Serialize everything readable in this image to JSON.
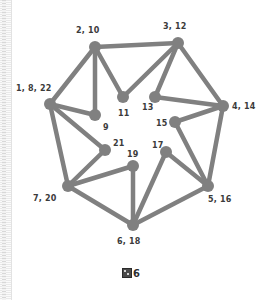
{
  "figure": {
    "caption_glyph": "tofu-box",
    "caption_text": "6",
    "background_color": "#ffffff",
    "node_color": "#808080",
    "edge_color": "#808080",
    "label_color": "#3b3b3b"
  },
  "chart_data": {
    "type": "diagram",
    "subtype": "node-link-graph",
    "title": "",
    "layout": "planar circular embedding",
    "node_radius": 6,
    "edge_width": 4.5,
    "nodes": [
      {
        "id": "n2_10",
        "label": "2, 10",
        "x": 95,
        "y": 47,
        "label_x": 76,
        "label_y": 27
      },
      {
        "id": "n3_12",
        "label": "3, 12",
        "x": 178,
        "y": 43,
        "label_x": 163,
        "label_y": 23
      },
      {
        "id": "n1_8_22",
        "label": "1, 8, 22",
        "x": 50,
        "y": 104,
        "label_x": 16,
        "label_y": 85
      },
      {
        "id": "n4_14",
        "label": "4, 14",
        "x": 223,
        "y": 106,
        "label_x": 232,
        "label_y": 103
      },
      {
        "id": "n9",
        "label": "9",
        "x": 95,
        "y": 115,
        "label_x": 103,
        "label_y": 124
      },
      {
        "id": "n11",
        "label": "11",
        "x": 123,
        "y": 97,
        "label_x": 118,
        "label_y": 110
      },
      {
        "id": "n13",
        "label": "13",
        "x": 155,
        "y": 97,
        "label_x": 142,
        "label_y": 104
      },
      {
        "id": "n15",
        "label": "15",
        "x": 175,
        "y": 122,
        "label_x": 156,
        "label_y": 120
      },
      {
        "id": "n17",
        "label": "17",
        "x": 166,
        "y": 152,
        "label_x": 152,
        "label_y": 142
      },
      {
        "id": "n21",
        "label": "21",
        "x": 105,
        "y": 150,
        "label_x": 113,
        "label_y": 140
      },
      {
        "id": "n19",
        "label": "19",
        "x": 133,
        "y": 166,
        "label_x": 127,
        "label_y": 151
      },
      {
        "id": "n7_20",
        "label": "7, 20",
        "x": 68,
        "y": 186,
        "label_x": 33,
        "label_y": 195
      },
      {
        "id": "n5_16",
        "label": "5, 16",
        "x": 208,
        "y": 186,
        "label_x": 208,
        "label_y": 196
      },
      {
        "id": "n6_18",
        "label": "6, 18",
        "x": 133,
        "y": 225,
        "label_x": 117,
        "label_y": 238
      }
    ],
    "edges": [
      [
        "n2_10",
        "n3_12"
      ],
      [
        "n2_10",
        "n1_8_22"
      ],
      [
        "n2_10",
        "n9"
      ],
      [
        "n2_10",
        "n11"
      ],
      [
        "n3_12",
        "n11"
      ],
      [
        "n3_12",
        "n13"
      ],
      [
        "n3_12",
        "n4_14"
      ],
      [
        "n13",
        "n4_14"
      ],
      [
        "n15",
        "n4_14"
      ],
      [
        "n15",
        "n5_16"
      ],
      [
        "n4_14",
        "n5_16"
      ],
      [
        "n1_8_22",
        "n9"
      ],
      [
        "n1_8_22",
        "n21"
      ],
      [
        "n1_8_22",
        "n7_20"
      ],
      [
        "n21",
        "n7_20"
      ],
      [
        "n7_20",
        "n19"
      ],
      [
        "n7_20",
        "n6_18"
      ],
      [
        "n19",
        "n6_18"
      ],
      [
        "n17",
        "n6_18"
      ],
      [
        "n17",
        "n5_16"
      ],
      [
        "n5_16",
        "n6_18"
      ]
    ],
    "node_count": 14,
    "edge_count": 21
  }
}
